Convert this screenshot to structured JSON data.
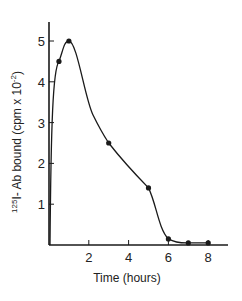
{
  "chart_data": {
    "type": "line",
    "title": "",
    "xlabel": "Time (hours)",
    "ylabel_prefix_sup": "125",
    "ylabel_main": "I- Ab bound (cpm x 10",
    "ylabel_exp": "-2",
    "ylabel_suffix": ")",
    "ylabel": "125I- Ab bound (cpm x 10^-2)",
    "xlim": [
      0,
      9
    ],
    "ylim": [
      0,
      5.5
    ],
    "x_ticks": [
      2,
      4,
      6,
      8
    ],
    "y_ticks": [
      1,
      2,
      3,
      4,
      5
    ],
    "grid": false,
    "legend": null,
    "series": [
      {
        "name": "125I-Ab bound",
        "x": [
          0.5,
          1,
          3,
          5,
          6,
          7,
          8
        ],
        "values": [
          4.5,
          5.0,
          2.5,
          1.4,
          0.15,
          0.05,
          0.05
        ]
      }
    ],
    "color": "#1a1a1a"
  }
}
